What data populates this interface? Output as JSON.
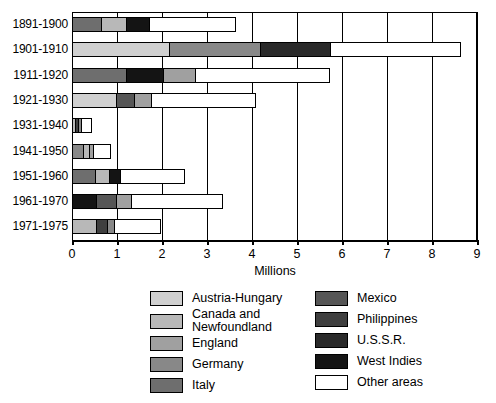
{
  "chart_data": {
    "type": "bar",
    "orientation": "horizontal",
    "stacked": true,
    "title": "",
    "xlabel": "Millions",
    "ylabel": "",
    "xlim": [
      0,
      9
    ],
    "xticks": [
      0,
      1,
      2,
      3,
      4,
      5,
      6,
      7,
      8,
      9
    ],
    "xticklabels": [
      "0",
      "1",
      "2",
      "3",
      "4",
      "5",
      "6",
      "7",
      "8",
      "9"
    ],
    "grid": true,
    "legend_position": "below",
    "categories": [
      "1891-1900",
      "1901-1910",
      "1911-1920",
      "1921-1930",
      "1931-1940",
      "1941-1950",
      "1951-1960",
      "1961-1970",
      "1971-1975"
    ],
    "series": [
      {
        "name": "Austria-Hungary",
        "color": "#d0d0d0",
        "values": [
          0.0,
          2.18,
          0.0,
          1.01,
          0.0,
          0.0,
          0.0,
          0.0,
          0.0
        ]
      },
      {
        "name": "Canada and\nNewfoundland",
        "color": "#b8b8b8",
        "values": [
          0.58,
          0.0,
          0.0,
          0.0,
          0.1,
          0.18,
          0.33,
          0.0,
          0.55
        ]
      },
      {
        "name": "England",
        "color": "#a0a0a0",
        "values": [
          0.0,
          0.0,
          0.74,
          0.41,
          0.0,
          0.1,
          0.0,
          0.37,
          0.0
        ]
      },
      {
        "name": "Germany",
        "color": "#888888",
        "values": [
          0.0,
          2.06,
          0.0,
          0.0,
          0.08,
          0.26,
          0.0,
          0.0,
          0.19
        ]
      },
      {
        "name": "Italy",
        "color": "#6e6e6e",
        "values": [
          0.67,
          0.0,
          1.23,
          0.0,
          0.0,
          0.0,
          0.54,
          0.0,
          0.0
        ]
      },
      {
        "name": "Mexico",
        "color": "#565656",
        "values": [
          0.0,
          0.0,
          0.0,
          0.41,
          0.0,
          0.0,
          0.0,
          0.46,
          0.0
        ]
      },
      {
        "name": "Philippines",
        "color": "#3f3f3f",
        "values": [
          0.0,
          0.0,
          0.0,
          0.0,
          0.09,
          0.0,
          0.0,
          0.0,
          0.28
        ]
      },
      {
        "name": "U.S.S.R.",
        "color": "#2a2a2a",
        "values": [
          0.0,
          1.57,
          0.0,
          0.0,
          0.0,
          0.0,
          0.0,
          0.0,
          0.0
        ]
      },
      {
        "name": "West Indies",
        "color": "#141414",
        "values": [
          0.53,
          0.0,
          0.84,
          0.0,
          0.0,
          0.0,
          0.28,
          0.56,
          0.0
        ]
      },
      {
        "name": "Other areas",
        "color": "#ffffff",
        "values": [
          1.95,
          2.92,
          3.0,
          2.33,
          0.26,
          0.41,
          1.43,
          2.04,
          1.04
        ]
      }
    ],
    "totals": [
      3.73,
      8.73,
      5.81,
      4.16,
      0.53,
      0.95,
      2.58,
      3.43,
      2.06
    ],
    "stacks": [
      {
        "category": "1891-1900",
        "segments": [
          {
            "series": "Italy",
            "value": 0.67
          },
          {
            "series": "Canada and\nNewfoundland",
            "value": 0.58
          },
          {
            "series": "West Indies",
            "value": 0.53
          },
          {
            "series": "Other areas",
            "value": 1.95
          }
        ]
      },
      {
        "category": "1901-1910",
        "segments": [
          {
            "series": "Austria-Hungary",
            "value": 2.18
          },
          {
            "series": "Germany",
            "value": 2.06
          },
          {
            "series": "U.S.S.R.",
            "value": 1.57
          },
          {
            "series": "Other areas",
            "value": 2.92
          }
        ]
      },
      {
        "category": "1911-1920",
        "segments": [
          {
            "series": "Italy",
            "value": 1.23
          },
          {
            "series": "West Indies",
            "value": 0.84
          },
          {
            "series": "England",
            "value": 0.74
          },
          {
            "series": "Other areas",
            "value": 3.0
          }
        ]
      },
      {
        "category": "1921-1930",
        "segments": [
          {
            "series": "Austria-Hungary",
            "value": 1.01
          },
          {
            "series": "Mexico",
            "value": 0.41
          },
          {
            "series": "England",
            "value": 0.41
          },
          {
            "series": "Other areas",
            "value": 2.33
          }
        ]
      },
      {
        "category": "1931-1940",
        "segments": [
          {
            "series": "Canada and\nNewfoundland",
            "value": 0.1
          },
          {
            "series": "Philippines",
            "value": 0.09
          },
          {
            "series": "Germany",
            "value": 0.08
          },
          {
            "series": "Other areas",
            "value": 0.26
          }
        ]
      },
      {
        "category": "1941-1950",
        "segments": [
          {
            "series": "Germany",
            "value": 0.26
          },
          {
            "series": "Canada and\nNewfoundland",
            "value": 0.18
          },
          {
            "series": "England",
            "value": 0.1
          },
          {
            "series": "Other areas",
            "value": 0.41
          }
        ]
      },
      {
        "category": "1951-1960",
        "segments": [
          {
            "series": "Italy",
            "value": 0.54
          },
          {
            "series": "Canada and\nNewfoundland",
            "value": 0.33
          },
          {
            "series": "West Indies",
            "value": 0.28
          },
          {
            "series": "Other areas",
            "value": 1.43
          }
        ]
      },
      {
        "category": "1961-1970",
        "segments": [
          {
            "series": "West Indies",
            "value": 0.56
          },
          {
            "series": "Mexico",
            "value": 0.46
          },
          {
            "series": "England",
            "value": 0.37
          },
          {
            "series": "Other areas",
            "value": 2.04
          }
        ]
      },
      {
        "category": "1971-1975",
        "segments": [
          {
            "series": "Canada and\nNewfoundland",
            "value": 0.55
          },
          {
            "series": "Philippines",
            "value": 0.28
          },
          {
            "series": "Germany",
            "value": 0.19
          },
          {
            "series": "Other areas",
            "value": 1.04
          }
        ]
      }
    ]
  },
  "legend": {
    "left_column": [
      {
        "label": "Austria-Hungary",
        "color": "#d0d0d0"
      },
      {
        "label": "Canada and\nNewfoundland",
        "color": "#b8b8b8"
      },
      {
        "label": "England",
        "color": "#a0a0a0"
      },
      {
        "label": "Germany",
        "color": "#888888"
      },
      {
        "label": "Italy",
        "color": "#6e6e6e"
      }
    ],
    "right_column": [
      {
        "label": "Mexico",
        "color": "#565656"
      },
      {
        "label": "Philippines",
        "color": "#3f3f3f"
      },
      {
        "label": "U.S.S.R.",
        "color": "#2a2a2a"
      },
      {
        "label": "West Indies",
        "color": "#141414"
      },
      {
        "label": "Other areas",
        "color": "#ffffff"
      }
    ]
  }
}
